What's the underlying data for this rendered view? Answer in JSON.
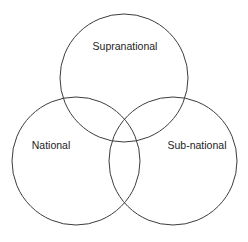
{
  "diagram": {
    "type": "venn",
    "title": "",
    "background_color": "#ffffff",
    "stroke_color": "#3c3c3c",
    "stroke_width": 1,
    "text_color": "#1d1d1d",
    "font_size_px": 10.5,
    "canvas": {
      "width": 248,
      "height": 242
    },
    "sets": [
      {
        "id": "supranational",
        "label": "Supranational",
        "cx": 124,
        "cy": 78,
        "r": 64,
        "label_x": 125,
        "label_y": 47
      },
      {
        "id": "national",
        "label": "National",
        "cx": 76,
        "cy": 161,
        "r": 64,
        "label_x": 51,
        "label_y": 146
      },
      {
        "id": "sub-national",
        "label": "Sub-national",
        "cx": 173,
        "cy": 161,
        "r": 64,
        "label_x": 197,
        "label_y": 146
      }
    ]
  }
}
